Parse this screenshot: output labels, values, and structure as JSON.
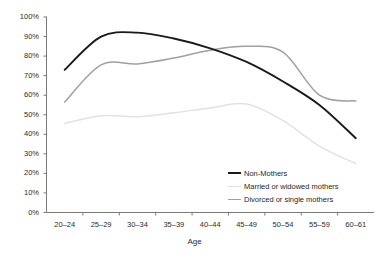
{
  "chart_data": {
    "type": "line",
    "title": "",
    "xlabel": "Age",
    "ylabel": "",
    "categories": [
      "20–24",
      "25–29",
      "30–34",
      "35–39",
      "40–44",
      "45–49",
      "50–54",
      "55–59",
      "60–61"
    ],
    "ylim": [
      0,
      100
    ],
    "y_tick_labels": [
      "0%",
      "10%",
      "20%",
      "30%",
      "40%",
      "50%",
      "60%",
      "70%",
      "80%",
      "90%",
      "100%"
    ],
    "y_tick_values": [
      0,
      10,
      20,
      30,
      40,
      50,
      60,
      70,
      80,
      90,
      100
    ],
    "grid": false,
    "legend_position": "inside-bottom-right",
    "series": [
      {
        "name": "Non-Mothers",
        "color": "#1a1a1a",
        "width": 1.9,
        "values": [
          73,
          90,
          92,
          89,
          84,
          77,
          67,
          55,
          38
        ]
      },
      {
        "name": "Married or widowed mothers",
        "color": "#e2e2e2",
        "width": 1.5,
        "values": [
          45.5,
          49.5,
          49,
          51,
          53.5,
          55.5,
          47,
          34,
          25
        ]
      },
      {
        "name": "Divorced or single mothers",
        "color": "#a0a0a0",
        "width": 1.5,
        "values": [
          56.5,
          75.5,
          76,
          79,
          83,
          85,
          82,
          60,
          57
        ]
      }
    ]
  },
  "axis": {
    "x_title": "Age"
  }
}
